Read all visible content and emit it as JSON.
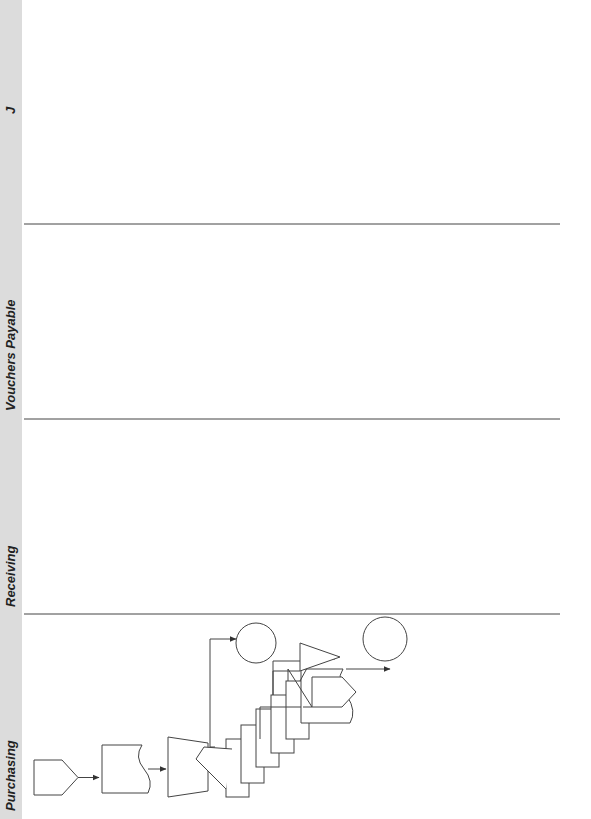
{
  "figure": {
    "number": "FIGURE 2.29"
  },
  "lanes": [
    {
      "id": "purchasing",
      "title": "Purchasing"
    },
    {
      "id": "receiving",
      "title": "Receiving"
    },
    {
      "id": "vouchers_payable",
      "title": "Vouchers Payable"
    },
    {
      "id": "j",
      "title": "J"
    }
  ],
  "purchasing": {
    "from_stores": "From\nStores",
    "approved_requisition": {
      "label": "Approved\nRequisition",
      "copy": "1"
    },
    "process_a": "A",
    "document_set": [
      {
        "label": "Requisition",
        "copy": "1"
      },
      {
        "label": "Pur. Order",
        "copy": "5"
      },
      {
        "label": "Pur. Order",
        "copy": "4"
      },
      {
        "label": "Pur. Order",
        "copy": "3"
      },
      {
        "label": "Pur. Order",
        "copy": "2"
      },
      {
        "label": "Purchase\nOrder",
        "copy": "1"
      }
    ],
    "to_stores": "To\nStores",
    "file_by_number": "By\nNum-\nber",
    "to_receiving": "To\nReceiv-\ning",
    "to_vouchers_payable": "To\nVouchers\nPayable",
    "connector_b": "B"
  },
  "receiving": {
    "from_purch": "From\nPurch.",
    "purchase_order": {
      "label": "Purchase\nOrder",
      "copy": "4"
    },
    "receive_goods": "Receive\nGoods\nMatch with\nPur. Order",
    "process_c": "C",
    "document_set": [
      {
        "label": "Pur. Order",
        "copy": "4"
      },
      {
        "label": "Rec. Report",
        "copy": "4"
      },
      {
        "label": "Rec. Report",
        "copy": "3"
      },
      {
        "label": "Rec. Report",
        "copy": "2"
      },
      {
        "label": "Receiving\nReport",
        "copy": "1"
      }
    ],
    "to_vouchers_payable": "To\nVouchers\nPayable",
    "to_stores": "To\nStores",
    "receipts_note": "For\nReceipts\nand Returns",
    "file_by_number": "By\nNum-\nber"
  },
  "vouchers_payable": {
    "connector_d": "D",
    "connector_e": "E",
    "from_vendor": "From\nVendor",
    "requisition": {
      "label": "Requisition",
      "copy": "1"
    },
    "doc_f": "F",
    "doc_g": "G",
    "invoice": "Invoice",
    "file_by_name": "By\nName",
    "file_note": "File\nPending\nArrival\nof All\nDocuments",
    "match_documents": "Match\nDocuments",
    "process_h": "H",
    "document_set": [
      {
        "label": "Voucher",
        "copy": "2"
      },
      {
        "label": "Requisition",
        "copy": "1"
      },
      {
        "label": "Pur. Order",
        "copy": "5"
      },
      {
        "label": "Rec. Report",
        "copy": "1"
      },
      {
        "label": "Invoice",
        "copy": ""
      },
      {
        "label": "Approved\nVoucher",
        "copy": "1"
      }
    ],
    "to_general_accounting": "To\nGeneral\nAccount-\ning",
    "file_by_i": "By\n\nI",
    "to_treasurer": "To\nTreas-\nurer",
    "due_date_note": "On\nDue\nDate"
  },
  "j": {
    "from_vouchers_payable": "From\nVouchers\nPayable",
    "voucher_package": {
      "title": "Voucher Package",
      "documents": [
        {
          "label": "Requisition",
          "copy": "1"
        },
        {
          "label": "Pur. Order",
          "copy": "5"
        },
        {
          "label": "Rec. Report",
          "copy": "1"
        },
        {
          "label": "Invoice",
          "copy": ""
        },
        {
          "label": "Approved\nVoucher",
          "copy": "1"
        }
      ]
    },
    "review_documents": "Review\nDocuments,\nPrepare\nCheck, and\nRemittance\nAdvice",
    "process_k": "K",
    "doc_l": "L",
    "file_by_number": "By\nNum-\nber",
    "canceled_file_note": "Canceled\nVoucher\nPackage\nFile",
    "document_set": [
      {
        "label": "Check Copy",
        "copy": ""
      },
      {
        "label": "Remittance",
        "copy": "2"
      },
      {
        "label": "Signed Check",
        "copy": ""
      },
      {
        "label": "Remittance\nAdvice",
        "copy": "1"
      }
    ],
    "to_general_accounting": "To\nGeneral\nAccount-\ning",
    "to_vendor": "To\nVendor"
  },
  "colors": {
    "lane_header": "#dcdcdc",
    "line": "#333333",
    "background": "#ffffff"
  }
}
